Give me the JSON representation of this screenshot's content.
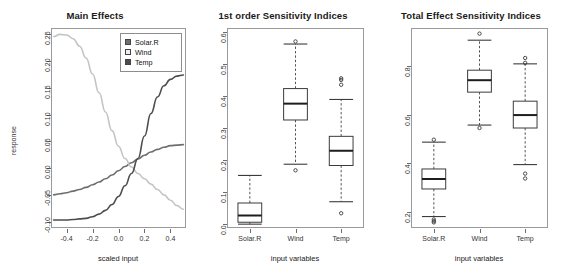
{
  "figure": {
    "background": "#ffffff",
    "line_dark": "#4d4d4d",
    "line_light": "#c4c4c4",
    "line_mid": "#6e6e6e",
    "frame_color": "#9a9a9a"
  },
  "panels": [
    {
      "id": "main-effects",
      "title": "Main Effects",
      "xlabel": "scaled input",
      "ylabel": "response"
    },
    {
      "id": "first-order",
      "title": "1st order Sensitivity Indices",
      "xlabel": "input variables",
      "ylabel": ""
    },
    {
      "id": "total-effect",
      "title": "Total Effect Sensitivity Indices",
      "xlabel": "input variables",
      "ylabel": ""
    }
  ],
  "legend": {
    "entries": [
      {
        "label": "Solar.R",
        "color": "#6e6e6e"
      },
      {
        "label": "Wind",
        "color": "#e8e8e8"
      },
      {
        "label": "Temp",
        "color": "#4d4d4d"
      }
    ]
  },
  "chart_data": [
    {
      "type": "line",
      "id": "main-effects",
      "title": "Main Effects",
      "xlabel": "scaled input",
      "ylabel": "response",
      "xlim": [
        -0.52,
        0.52
      ],
      "ylim": [
        -0.112,
        0.262
      ],
      "xticks": [
        -0.4,
        -0.2,
        0.0,
        0.2,
        0.4
      ],
      "xtick_labels": [
        "-0.4",
        "-0.2",
        "0.0",
        "0.2",
        "0.4"
      ],
      "yticks": [
        -0.1,
        -0.05,
        0.0,
        0.05,
        0.1,
        0.15,
        0.2,
        0.25
      ],
      "ytick_labels": [
        "-0.10",
        "-0.05",
        "0.00",
        "0.05",
        "0.10",
        "0.15",
        "0.20",
        "0.25"
      ],
      "grid": false,
      "legend_position": "top-right",
      "x": [
        -0.5,
        -0.45,
        -0.4,
        -0.35,
        -0.3,
        -0.25,
        -0.2,
        -0.15,
        -0.1,
        -0.05,
        0.0,
        0.05,
        0.1,
        0.15,
        0.2,
        0.25,
        0.3,
        0.35,
        0.4,
        0.45,
        0.5
      ],
      "series": [
        {
          "name": "Solar.R",
          "color": "#6e6e6e",
          "values": [
            -0.05,
            -0.048,
            -0.046,
            -0.043,
            -0.04,
            -0.036,
            -0.031,
            -0.026,
            -0.02,
            -0.013,
            -0.005,
            0.003,
            0.01,
            0.017,
            0.024,
            0.03,
            0.035,
            0.039,
            0.042,
            0.043,
            0.044
          ]
        },
        {
          "name": "Wind",
          "color": "#c4c4c4",
          "values": [
            0.246,
            0.25,
            0.249,
            0.242,
            0.228,
            0.206,
            0.176,
            0.141,
            0.105,
            0.07,
            0.041,
            0.018,
            0.002,
            -0.01,
            -0.02,
            -0.03,
            -0.04,
            -0.05,
            -0.06,
            -0.07,
            -0.077
          ]
        },
        {
          "name": "Temp",
          "color": "#4d4d4d",
          "values": [
            -0.097,
            -0.097,
            -0.097,
            -0.096,
            -0.095,
            -0.094,
            -0.091,
            -0.086,
            -0.079,
            -0.068,
            -0.053,
            -0.033,
            -0.01,
            0.018,
            0.06,
            0.102,
            0.133,
            0.154,
            0.166,
            0.172,
            0.174
          ]
        }
      ]
    },
    {
      "type": "box",
      "id": "first-order",
      "title": "1st order Sensitivity Indices",
      "xlabel": "input variables",
      "ylabel": "",
      "ylim": [
        -0.012,
        0.612
      ],
      "yticks": [
        0.0,
        0.1,
        0.2,
        0.3,
        0.4,
        0.5,
        0.6
      ],
      "ytick_labels": [
        "0.0",
        "0.1",
        "0.2",
        "0.3",
        "0.4",
        "0.5",
        "0.6"
      ],
      "categories": [
        "Solar.R",
        "Wind",
        "Temp"
      ],
      "grid": false,
      "boxes": [
        {
          "name": "Solar.R",
          "whisker_low": 0.0,
          "q1": 0.006,
          "median": 0.027,
          "q3": 0.066,
          "whisker_high": 0.152,
          "outliers": []
        },
        {
          "name": "Wind",
          "whisker_low": 0.187,
          "q1": 0.325,
          "median": 0.376,
          "q3": 0.423,
          "whisker_high": 0.562,
          "outliers": [
            0.57,
            0.168
          ]
        },
        {
          "name": "Temp",
          "whisker_low": 0.07,
          "q1": 0.183,
          "median": 0.229,
          "q3": 0.274,
          "whisker_high": 0.389,
          "outliers": [
            0.455,
            0.45,
            0.435,
            0.034
          ]
        }
      ]
    },
    {
      "type": "box",
      "id": "total-effect",
      "title": "Total Effect Sensitivity Indices",
      "xlabel": "input variables",
      "ylabel": "",
      "ylim": [
        0.135,
        0.955
      ],
      "yticks": [
        0.2,
        0.4,
        0.6,
        0.8
      ],
      "ytick_labels": [
        "0.2",
        "0.4",
        "0.6",
        "0.8"
      ],
      "categories": [
        "Solar.R",
        "Wind",
        "Temp"
      ],
      "grid": false,
      "boxes": [
        {
          "name": "Solar.R",
          "whisker_low": 0.182,
          "q1": 0.295,
          "median": 0.336,
          "q3": 0.377,
          "whisker_high": 0.487,
          "outliers": [
            0.497,
            0.17,
            0.163,
            0.158
          ]
        },
        {
          "name": "Wind",
          "whisker_low": 0.557,
          "q1": 0.692,
          "median": 0.741,
          "q3": 0.782,
          "whisker_high": 0.905,
          "outliers": [
            0.932,
            0.545
          ]
        },
        {
          "name": "Temp",
          "whisker_low": 0.395,
          "q1": 0.545,
          "median": 0.598,
          "q3": 0.655,
          "whisker_high": 0.808,
          "outliers": [
            0.832,
            0.812,
            0.358,
            0.338
          ]
        }
      ]
    }
  ]
}
